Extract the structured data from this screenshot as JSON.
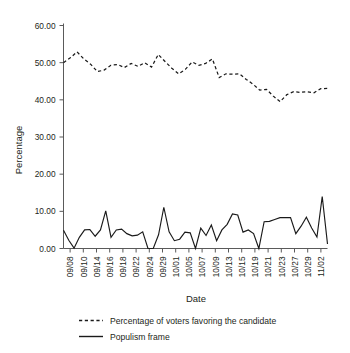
{
  "chart_data": {
    "type": "line",
    "title": "",
    "xlabel": "Date",
    "ylabel": "Percentage",
    "ylim": [
      0,
      60
    ],
    "yticks": [
      0,
      10,
      20,
      30,
      40,
      50,
      60
    ],
    "ytick_labels": [
      "0.00",
      "10.00",
      "20.00",
      "30.00",
      "40.00",
      "50.00",
      "60.00"
    ],
    "grid": false,
    "legend_position": "below",
    "x": [
      "09/08",
      "09/09",
      "09/10",
      "09/11",
      "09/14",
      "09/15",
      "09/16",
      "09/17",
      "09/18",
      "09/19",
      "09/22",
      "09/23",
      "09/24",
      "09/25",
      "09/29",
      "09/30",
      "10/01",
      "10/02",
      "10/05",
      "10/06",
      "10/07",
      "10/08",
      "10/09",
      "10/12",
      "10/13",
      "10/14",
      "10/15",
      "10/16",
      "10/19",
      "10/20",
      "10/21",
      "10/22",
      "10/23",
      "10/26",
      "10/27",
      "10/28",
      "10/29",
      "10/30",
      "11/02",
      "11/03"
    ],
    "xtick_labels": [
      "09/08",
      "09/10",
      "09/14",
      "09/16",
      "09/18",
      "09/22",
      "09/24",
      "09/29",
      "10/01",
      "10/05",
      "10/07",
      "10/09",
      "10/13",
      "10/15",
      "10/19",
      "10/21",
      "10/23",
      "10/27",
      "10/29",
      "11/02"
    ],
    "series": [
      {
        "name": "Percentage of voters favoring the candidate",
        "style": "dashed",
        "color": "#1a1a1a",
        "values": [
          50.0,
          51.3,
          52.9,
          51.0,
          49.6,
          47.6,
          48.0,
          49.3,
          49.5,
          48.7,
          49.8,
          49.0,
          50.0,
          48.8,
          52.2,
          50.3,
          48.5,
          47.0,
          48.2,
          50.2,
          49.3,
          49.8,
          51.0,
          46.0,
          47.0,
          46.9,
          47.0,
          45.5,
          44.2,
          42.6,
          42.8,
          41.0,
          39.5,
          41.4,
          42.2,
          42.0,
          42.2,
          41.9,
          43.0,
          43.1
        ]
      },
      {
        "name": "Populism frame",
        "style": "solid",
        "color": "#1a1a1a",
        "values": [
          4.9,
          2.2,
          0.1,
          3.0,
          5.0,
          5.1,
          3.3,
          5.0,
          10.1,
          3.0,
          5.0,
          5.2,
          4.0,
          3.4,
          3.6,
          4.5,
          0.0,
          0.0,
          3.7,
          11.1,
          4.5,
          2.1,
          2.5,
          4.4,
          4.2,
          0.0,
          5.5,
          3.5,
          6.3,
          2.1,
          5.0,
          6.5,
          9.3,
          9.0,
          4.4,
          5.0,
          4.0,
          0.0,
          7.2,
          7.3
        ]
      }
    ],
    "series_extra": {
      "populism_tail": [
        7.8,
        8.3,
        8.3,
        8.3,
        4.0,
        6.0,
        8.4,
        5.5,
        3.1,
        14.0,
        1.2
      ],
      "voters_tail": []
    }
  },
  "legend": {
    "entries": [
      {
        "label": "Percentage of voters favoring the candidate",
        "style": "dashed"
      },
      {
        "label": "Populism frame",
        "style": "solid"
      }
    ]
  },
  "axes": {
    "ylabel": "Percentage",
    "xlabel": "Date"
  }
}
